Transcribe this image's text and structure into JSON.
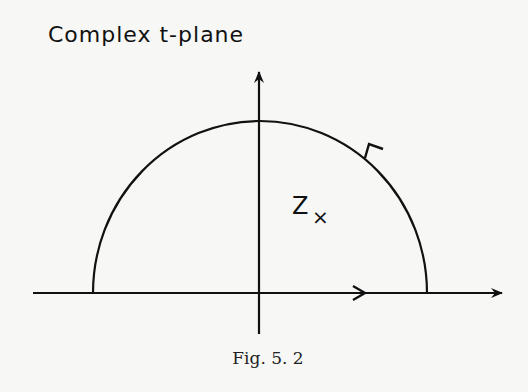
{
  "title": "Complex   t-plane",
  "point_label": "Z",
  "point_marker": "×",
  "caption": "Fig. 5. 2",
  "colors": {
    "ink": "#111111",
    "background": "#f7f7f5"
  }
}
